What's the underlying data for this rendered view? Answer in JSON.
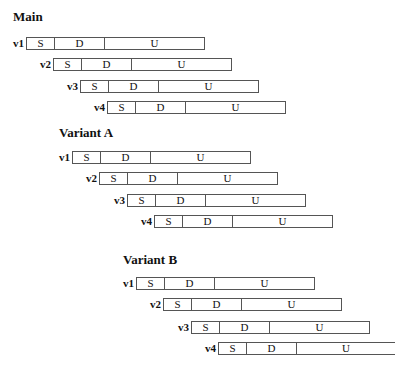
{
  "groups": [
    {
      "title": "Main",
      "title_pos": [
        13,
        10
      ],
      "rows": [
        {
          "label": "v1",
          "x": 26,
          "y": 37,
          "open_right": false
        },
        {
          "label": "v2",
          "x": 53,
          "y": 58,
          "open_right": false
        },
        {
          "label": "v3",
          "x": 80,
          "y": 80,
          "open_right": false
        },
        {
          "label": "v4",
          "x": 107,
          "y": 101,
          "open_right": false
        }
      ]
    },
    {
      "title": "Variant A",
      "title_pos": [
        59,
        126
      ],
      "rows": [
        {
          "label": "v1",
          "x": 72,
          "y": 151,
          "open_right": false
        },
        {
          "label": "v2",
          "x": 99,
          "y": 172,
          "open_right": false
        },
        {
          "label": "v3",
          "x": 127,
          "y": 194,
          "open_right": false
        },
        {
          "label": "v4",
          "x": 154,
          "y": 215,
          "open_right": false
        }
      ]
    },
    {
      "title": "Variant B",
      "title_pos": [
        123,
        253
      ],
      "rows": [
        {
          "label": "v1",
          "x": 136,
          "y": 277,
          "open_right": false
        },
        {
          "label": "v2",
          "x": 163,
          "y": 298,
          "open_right": false
        },
        {
          "label": "v3",
          "x": 191,
          "y": 321,
          "open_right": false
        },
        {
          "label": "v4",
          "x": 218,
          "y": 342,
          "open_right": true
        }
      ]
    }
  ],
  "segments": {
    "s": "S",
    "d": "D",
    "u": "U"
  },
  "bar_width": 179
}
